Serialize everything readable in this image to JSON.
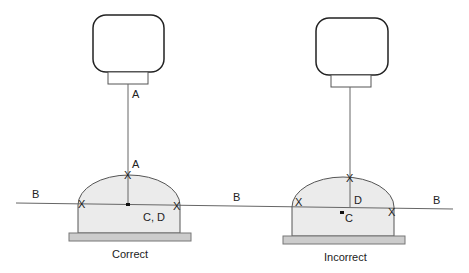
{
  "diagram": {
    "type": "camera-alignment-over-dome",
    "colors": {
      "line": "#555555",
      "outline": "#222222",
      "dome_fill": "#ebebeb",
      "base_fill": "#cccccc",
      "text": "#222222"
    },
    "reference_line": {
      "label": "B",
      "label_positions": [
        "left",
        "middle",
        "right"
      ]
    },
    "panels": [
      {
        "id": "correct",
        "caption": "Correct",
        "camera_axis_label": "A",
        "apex_label": "A",
        "center_label": "C, D",
        "markers": [
          "X",
          "X",
          "X"
        ]
      },
      {
        "id": "incorrect",
        "caption": "Incorrect",
        "camera_axis_label": "",
        "apex_label": "D",
        "center_label": "C",
        "markers": [
          "X",
          "X",
          "X"
        ]
      }
    ]
  }
}
